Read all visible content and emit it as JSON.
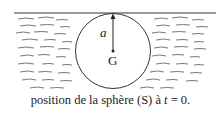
{
  "diagram": {
    "radius_label": "a",
    "center_label": "G",
    "caption": "position de la sphère (S) à t = 0.",
    "caption_parts": {
      "before": "position de la sphère (S) à ",
      "var": "t",
      "after": " = 0."
    },
    "colors": {
      "ink": "#222222",
      "background": "#ffffff"
    },
    "elements": [
      "free-surface-line",
      "fluid-hatching",
      "sphere-circle",
      "radius-arrow",
      "center-point"
    ]
  }
}
